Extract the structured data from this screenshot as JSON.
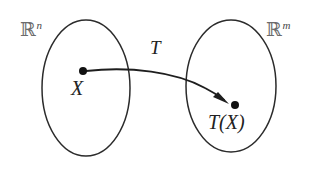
{
  "figure": {
    "background_color": "#ffffff",
    "stroke_color": "#2b2b2b",
    "label_color": "#2a2a2a",
    "blackboard_color": "#6b6b6b"
  },
  "domain_set": {
    "symbol": "ℝ",
    "superscript": "n",
    "full_label": "ℝⁿ",
    "shape": "ellipse",
    "center_x": 86,
    "center_y": 88,
    "radius_x": 44,
    "radius_y": 68
  },
  "codomain_set": {
    "symbol": "ℝ",
    "superscript": "m",
    "full_label": "ℝᵐ",
    "shape": "ellipse",
    "center_x": 231,
    "center_y": 86,
    "radius_x": 45,
    "radius_y": 66
  },
  "source_point": {
    "label": "X",
    "x": 83,
    "y": 71,
    "dot_radius": 4
  },
  "image_point": {
    "label": "T(X)",
    "x": 235,
    "y": 105,
    "dot_radius": 4
  },
  "mapping": {
    "label": "T",
    "label_x": 157,
    "label_y": 50,
    "arrow_style": "curved-with-filled-head"
  }
}
